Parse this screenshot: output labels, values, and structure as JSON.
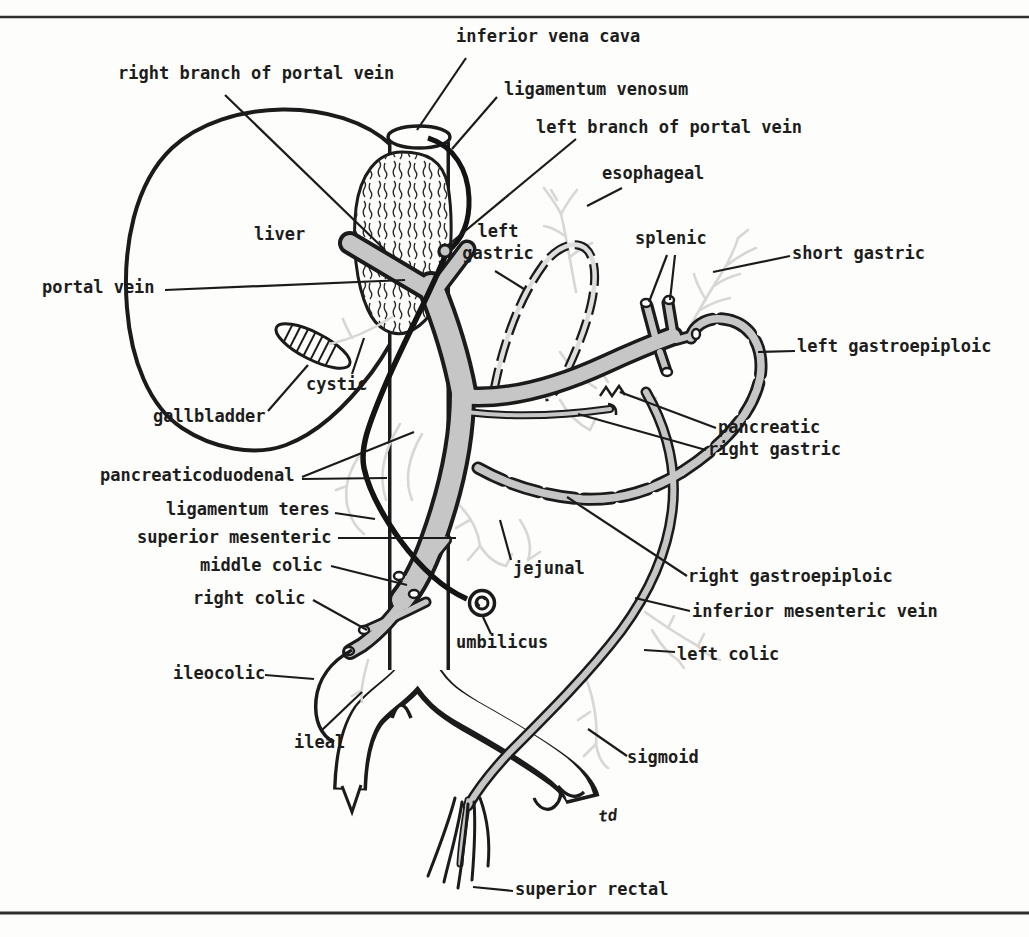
{
  "figure": {
    "type": "anatomical line diagram",
    "signature": "td"
  },
  "colors": {
    "ink": "#1b1b1b",
    "vessel_gray": "#c6c6c6",
    "twig_gray": "#d7d7d5",
    "paper": "#fdfdfb"
  },
  "labels": [
    {
      "id": "inferior-vena-cava",
      "text": "inferior vena cava"
    },
    {
      "id": "right-branch-portal-vein",
      "text": "right branch of portal vein"
    },
    {
      "id": "ligamentum-venosum",
      "text": "ligamentum venosum"
    },
    {
      "id": "left-branch-portal-vein",
      "text": "left branch of portal vein"
    },
    {
      "id": "esophageal",
      "text": "esophageal"
    },
    {
      "id": "left-gastric",
      "text": "left\ngastric"
    },
    {
      "id": "splenic",
      "text": "splenic"
    },
    {
      "id": "short-gastric",
      "text": "short gastric"
    },
    {
      "id": "liver",
      "text": "liver"
    },
    {
      "id": "portal-vein",
      "text": "portal vein"
    },
    {
      "id": "left-gastroepiploic",
      "text": "left gastroepiploic"
    },
    {
      "id": "cystic",
      "text": "cystic"
    },
    {
      "id": "gallbladder",
      "text": "gallbladder"
    },
    {
      "id": "pancreatic",
      "text": "pancreatic"
    },
    {
      "id": "right-gastric",
      "text": "right gastric"
    },
    {
      "id": "pancreaticoduodenal",
      "text": "pancreaticoduodenal"
    },
    {
      "id": "ligamentum-teres",
      "text": "ligamentum teres"
    },
    {
      "id": "superior-mesenteric",
      "text": "superior mesenteric"
    },
    {
      "id": "middle-colic",
      "text": "middle colic"
    },
    {
      "id": "jejunal",
      "text": "jejunal"
    },
    {
      "id": "right-gastroepiploic",
      "text": "right gastroepiploic"
    },
    {
      "id": "right-colic",
      "text": "right colic"
    },
    {
      "id": "inferior-mesenteric-vein",
      "text": "inferior mesenteric vein"
    },
    {
      "id": "umbilicus",
      "text": "umbilicus"
    },
    {
      "id": "left-colic",
      "text": "left colic"
    },
    {
      "id": "ileocolic",
      "text": "ileocolic"
    },
    {
      "id": "ileal",
      "text": "ileal"
    },
    {
      "id": "sigmoid",
      "text": "sigmoid"
    },
    {
      "id": "superior-rectal",
      "text": "superior rectal"
    }
  ]
}
